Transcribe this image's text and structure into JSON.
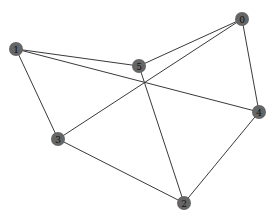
{
  "graph": {
    "node_color": "#666666",
    "edge_color": "#3a3a3a",
    "label_color": "#111111",
    "node_radius": 7,
    "nodes": [
      {
        "id": "0",
        "label": "0",
        "x": 242,
        "y": 19
      },
      {
        "id": "1",
        "label": "1",
        "x": 16,
        "y": 49
      },
      {
        "id": "2",
        "label": "2",
        "x": 184,
        "y": 203
      },
      {
        "id": "3",
        "label": "3",
        "x": 58,
        "y": 139
      },
      {
        "id": "4",
        "label": "4",
        "x": 259,
        "y": 112
      },
      {
        "id": "5",
        "label": "5",
        "x": 139,
        "y": 66
      }
    ],
    "edges": [
      {
        "source": "0",
        "target": "5"
      },
      {
        "source": "0",
        "target": "3"
      },
      {
        "source": "0",
        "target": "4"
      },
      {
        "source": "1",
        "target": "5"
      },
      {
        "source": "1",
        "target": "4"
      },
      {
        "source": "1",
        "target": "3"
      },
      {
        "source": "5",
        "target": "2"
      },
      {
        "source": "3",
        "target": "2"
      },
      {
        "source": "4",
        "target": "2"
      }
    ]
  }
}
